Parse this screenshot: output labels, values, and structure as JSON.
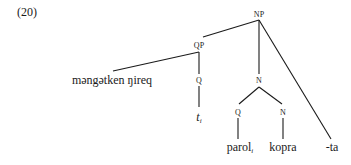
{
  "example_number": "(20)",
  "tree": {
    "nodes": {
      "np": {
        "label": "NP"
      },
      "qp": {
        "label": "QP"
      },
      "qp_spec": {
        "label": "məngətken ŋireq"
      },
      "q_head": {
        "label": "Q"
      },
      "trace": {
        "label": "t",
        "index": "i"
      },
      "n_bar": {
        "label": "N"
      },
      "n_q": {
        "label": "Q"
      },
      "n_n": {
        "label": "N"
      },
      "parol": {
        "label": "parol",
        "index": "i"
      },
      "kopra": {
        "label": "kopra"
      },
      "ta": {
        "label": "-ta"
      }
    },
    "edges": [
      [
        "np",
        "qp"
      ],
      [
        "np",
        "n_bar"
      ],
      [
        "np",
        "ta"
      ],
      [
        "qp",
        "qp_spec"
      ],
      [
        "qp",
        "q_head"
      ],
      [
        "q_head",
        "trace"
      ],
      [
        "n_bar",
        "n_q"
      ],
      [
        "n_bar",
        "n_n"
      ],
      [
        "n_q",
        "parol"
      ],
      [
        "n_n",
        "kopra"
      ]
    ]
  },
  "colors": {
    "line": "#1a1a1a",
    "text": "#1a1a1a"
  }
}
